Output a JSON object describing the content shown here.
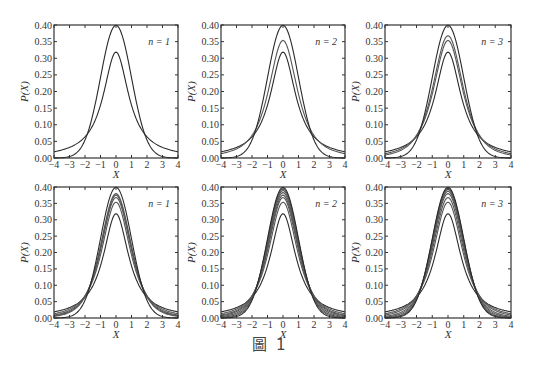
{
  "figure": {
    "caption": "圖 1"
  },
  "chart_data": [
    {
      "type": "line",
      "panel": "top-left",
      "label": "n = 1",
      "xlabel": "X",
      "ylabel": "P(X)",
      "xlim": [
        -4,
        4
      ],
      "ylim": [
        0,
        0.4
      ],
      "xticks": [
        "−4",
        "−3",
        "−2",
        "−1",
        "0",
        "1",
        "2",
        "3",
        "4"
      ],
      "yticks": [
        "0.00",
        "0.05",
        "0.10",
        "0.15",
        "0.20",
        "0.25",
        "0.30",
        "0.35",
        "0.40"
      ],
      "grid": false,
      "visible_curve_count": 2,
      "curves_inferred": true,
      "series": [
        {
          "name": "t(ν=1) [inferred]",
          "nu": 1,
          "peak": 0.318
        },
        {
          "name": "Gaussian [inferred]",
          "nu": null,
          "peak": 0.399
        }
      ]
    },
    {
      "type": "line",
      "panel": "top-middle",
      "label": "n = 2",
      "xlabel": "X",
      "ylabel": "P(X)",
      "xlim": [
        -4,
        4
      ],
      "ylim": [
        0,
        0.4
      ],
      "xticks": [
        "−4",
        "−3",
        "−2",
        "−1",
        "0",
        "1",
        "2",
        "3",
        "4"
      ],
      "yticks": [
        "0.00",
        "0.05",
        "0.10",
        "0.15",
        "0.20",
        "0.25",
        "0.30",
        "0.35",
        "0.40"
      ],
      "grid": false,
      "visible_curve_count": 3,
      "curves_inferred": true,
      "series": [
        {
          "name": "t(ν=1) [inferred]",
          "nu": 1,
          "peak": 0.318
        },
        {
          "name": "t(ν=2) [inferred]",
          "nu": 2,
          "peak": 0.354
        },
        {
          "name": "Gaussian [inferred]",
          "nu": null,
          "peak": 0.399
        }
      ]
    },
    {
      "type": "line",
      "panel": "top-right",
      "label": "n = 3",
      "xlabel": "X",
      "ylabel": "P(X)",
      "xlim": [
        -4,
        4
      ],
      "ylim": [
        0,
        0.4
      ],
      "xticks": [
        "−4",
        "−3",
        "−2",
        "−1",
        "0",
        "1",
        "2",
        "3",
        "4"
      ],
      "yticks": [
        "0.00",
        "0.05",
        "0.10",
        "0.15",
        "0.20",
        "0.25",
        "0.30",
        "0.35",
        "0.40"
      ],
      "grid": false,
      "visible_curve_count": 4,
      "curves_inferred": true,
      "series": [
        {
          "name": "t(ν=1) [inferred]",
          "nu": 1,
          "peak": 0.318
        },
        {
          "name": "t(ν=2) [inferred]",
          "nu": 2,
          "peak": 0.354
        },
        {
          "name": "t(ν=3) [inferred]",
          "nu": 3,
          "peak": 0.368
        },
        {
          "name": "Gaussian [inferred]",
          "nu": null,
          "peak": 0.399
        }
      ]
    },
    {
      "type": "line",
      "panel": "bottom-left",
      "label": "n = 1",
      "xlabel": "X",
      "ylabel": "P(X)",
      "xlim": [
        -4,
        4
      ],
      "ylim": [
        0,
        0.4
      ],
      "xticks": [
        "−4",
        "−3",
        "−2",
        "−1",
        "0",
        "1",
        "2",
        "3",
        "4"
      ],
      "yticks": [
        "0.00",
        "0.05",
        "0.10",
        "0.15",
        "0.20",
        "0.25",
        "0.30",
        "0.35",
        "0.40"
      ],
      "grid": false,
      "visible_curve_count": 6,
      "curves_inferred": true,
      "series": [
        {
          "name": "t(ν=1) [inferred]",
          "nu": 1,
          "peak": 0.318
        },
        {
          "name": "t(ν=2) [inferred]",
          "nu": 2,
          "peak": 0.354
        },
        {
          "name": "t(ν=3) [inferred]",
          "nu": 3,
          "peak": 0.368
        },
        {
          "name": "t(ν=4) [inferred]",
          "nu": 4,
          "peak": 0.375
        },
        {
          "name": "t(ν=5) [inferred]",
          "nu": 5,
          "peak": 0.38
        },
        {
          "name": "Gaussian [inferred]",
          "nu": null,
          "peak": 0.399
        }
      ]
    },
    {
      "type": "line",
      "panel": "bottom-middle",
      "label": "n = 2",
      "xlabel": "X",
      "ylabel": "P(X)",
      "xlim": [
        -4,
        4
      ],
      "ylim": [
        0,
        0.4
      ],
      "xticks": [
        "−4",
        "−3",
        "−2",
        "−1",
        "0",
        "1",
        "2",
        "3",
        "4"
      ],
      "yticks": [
        "0.00",
        "0.05",
        "0.10",
        "0.15",
        "0.20",
        "0.25",
        "0.30",
        "0.35",
        "0.40"
      ],
      "grid": false,
      "visible_curve_count": 8,
      "curves_inferred": true,
      "series": [
        {
          "name": "t(ν=1) [inferred]",
          "nu": 1,
          "peak": 0.318
        },
        {
          "name": "t(ν=2) [inferred]",
          "nu": 2,
          "peak": 0.354
        },
        {
          "name": "t(ν=3) [inferred]",
          "nu": 3,
          "peak": 0.368
        },
        {
          "name": "t(ν=4) [inferred]",
          "nu": 4,
          "peak": 0.375
        },
        {
          "name": "t(ν=6) [inferred]",
          "nu": 6,
          "peak": 0.383
        },
        {
          "name": "t(ν=10) [inferred]",
          "nu": 10,
          "peak": 0.389
        },
        {
          "name": "t(ν=20) [inferred]",
          "nu": 20,
          "peak": 0.394
        },
        {
          "name": "Gaussian [inferred]",
          "nu": null,
          "peak": 0.399
        }
      ]
    },
    {
      "type": "line",
      "panel": "bottom-right",
      "label": "n = 3",
      "xlabel": "X",
      "ylabel": "P(X)",
      "xlim": [
        -4,
        4
      ],
      "ylim": [
        0,
        0.4
      ],
      "xticks": [
        "−4",
        "−3",
        "−2",
        "−1",
        "0",
        "1",
        "2",
        "3",
        "4"
      ],
      "yticks": [
        "0.00",
        "0.05",
        "0.10",
        "0.15",
        "0.20",
        "0.25",
        "0.30",
        "0.35",
        "0.40"
      ],
      "grid": false,
      "visible_curve_count": 8,
      "curves_inferred": true,
      "series": [
        {
          "name": "t(ν=1) [inferred]",
          "nu": 1,
          "peak": 0.318
        },
        {
          "name": "t(ν=2) [inferred]",
          "nu": 2,
          "peak": 0.354
        },
        {
          "name": "t(ν=3) [inferred]",
          "nu": 3,
          "peak": 0.368
        },
        {
          "name": "t(ν=5) [inferred]",
          "nu": 5,
          "peak": 0.38
        },
        {
          "name": "t(ν=8) [inferred]",
          "nu": 8,
          "peak": 0.387
        },
        {
          "name": "t(ν=15) [inferred]",
          "nu": 15,
          "peak": 0.392
        },
        {
          "name": "t(ν=30) [inferred]",
          "nu": 30,
          "peak": 0.396
        },
        {
          "name": "Gaussian [inferred]",
          "nu": null,
          "peak": 0.399
        }
      ]
    }
  ],
  "layout": {
    "panels": [
      {
        "left": 54,
        "top": 25,
        "right": 178,
        "bottom": 158
      },
      {
        "left": 221,
        "top": 25,
        "right": 345,
        "bottom": 158
      },
      {
        "left": 385,
        "top": 25,
        "right": 511,
        "bottom": 158
      },
      {
        "left": 54,
        "top": 187,
        "right": 178,
        "bottom": 318
      },
      {
        "left": 221,
        "top": 187,
        "right": 345,
        "bottom": 318
      },
      {
        "left": 385,
        "top": 187,
        "right": 511,
        "bottom": 318
      }
    ],
    "colors": {
      "axis": "#333333",
      "curve": "#2a2a2a",
      "curve_light": "#555555"
    }
  }
}
